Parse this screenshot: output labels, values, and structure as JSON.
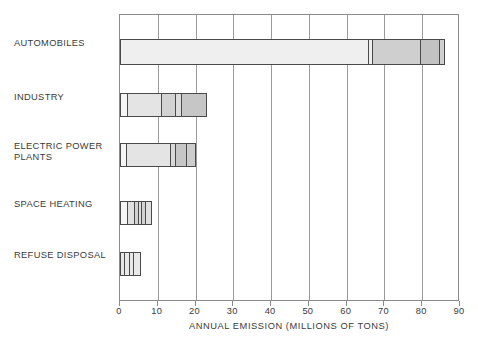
{
  "chart_data": {
    "type": "bar",
    "orientation": "horizontal",
    "title": "",
    "xlabel": "ANNUAL EMISSION (MILLIONS OF TONS)",
    "ylabel": "",
    "xlim": [
      0,
      90
    ],
    "xticks": [
      0,
      10,
      20,
      30,
      40,
      50,
      60,
      70,
      80,
      90
    ],
    "xtick_labels": [
      "0",
      "10",
      "20",
      "30",
      "40",
      "50",
      "60",
      "70",
      "80",
      "90"
    ],
    "grid": "vertical",
    "legend": "none",
    "categories": [
      "AUTOMOBILES",
      "INDUSTRY",
      "ELECTRIC POWER\nPLANTS",
      "SPACE HEATING",
      "REFUSE DISPOSAL"
    ],
    "totals": [
      86,
      23,
      20,
      8.5,
      5.5
    ],
    "stacked_segments": [
      {
        "category": "AUTOMOBILES",
        "total": 86,
        "segments": [
          {
            "start": 0,
            "end": 66,
            "value": 66,
            "fill": "#efefef"
          },
          {
            "start": 66,
            "end": 67,
            "value": 1,
            "fill": "#efefef"
          },
          {
            "start": 67,
            "end": 80,
            "value": 13,
            "fill": "#cfcfcf"
          },
          {
            "start": 80,
            "end": 85,
            "value": 5,
            "fill": "#c2c2c2"
          },
          {
            "start": 85,
            "end": 86,
            "value": 1,
            "fill": "#cfcfcf"
          }
        ]
      },
      {
        "category": "INDUSTRY",
        "total": 23,
        "segments": [
          {
            "start": 0,
            "end": 2,
            "value": 2,
            "fill": "#f5f5f5"
          },
          {
            "start": 2,
            "end": 11,
            "value": 9,
            "fill": "#e4e4e4"
          },
          {
            "start": 11,
            "end": 15,
            "value": 4,
            "fill": "#d2d2d2"
          },
          {
            "start": 15,
            "end": 16.5,
            "value": 1.5,
            "fill": "#dcdcdc"
          },
          {
            "start": 16.5,
            "end": 23,
            "value": 6.5,
            "fill": "#c6c6c6"
          }
        ]
      },
      {
        "category": "ELECTRIC POWER PLANTS",
        "total": 20,
        "segments": [
          {
            "start": 0,
            "end": 1.5,
            "value": 1.5,
            "fill": "#f5f5f5"
          },
          {
            "start": 1.5,
            "end": 13.5,
            "value": 12,
            "fill": "#e4e4e4"
          },
          {
            "start": 13.5,
            "end": 15,
            "value": 1.5,
            "fill": "#d8d8d8"
          },
          {
            "start": 15,
            "end": 18,
            "value": 3,
            "fill": "#c6c6c6"
          },
          {
            "start": 18,
            "end": 20,
            "value": 2,
            "fill": "#cccccc"
          }
        ]
      },
      {
        "category": "SPACE HEATING",
        "total": 8.5,
        "segments": [
          {
            "start": 0,
            "end": 2,
            "value": 2,
            "fill": "#f5f5f5"
          },
          {
            "start": 2,
            "end": 4,
            "value": 2,
            "fill": "#e0e0e0"
          },
          {
            "start": 4,
            "end": 5,
            "value": 1,
            "fill": "#d2d2d2"
          },
          {
            "start": 5,
            "end": 6,
            "value": 1,
            "fill": "#dcdcdc"
          },
          {
            "start": 6,
            "end": 7,
            "value": 1,
            "fill": "#d2d2d2"
          },
          {
            "start": 7,
            "end": 8.5,
            "value": 1.5,
            "fill": "#e0e0e0"
          }
        ]
      },
      {
        "category": "REFUSE DISPOSAL",
        "total": 5.5,
        "segments": [
          {
            "start": 0,
            "end": 1.3,
            "value": 1.3,
            "fill": "#e8e8e8"
          },
          {
            "start": 1.3,
            "end": 2.6,
            "value": 1.3,
            "fill": "#e8e8e8"
          },
          {
            "start": 2.6,
            "end": 3.9,
            "value": 1.3,
            "fill": "#e8e8e8"
          },
          {
            "start": 3.9,
            "end": 5.5,
            "value": 1.6,
            "fill": "#e8e8e8"
          }
        ]
      }
    ]
  },
  "axis": {
    "title": "ANNUAL EMISSION (MILLIONS OF TONS)",
    "ticks": [
      "0",
      "10",
      "20",
      "30",
      "40",
      "50",
      "60",
      "70",
      "80",
      "90"
    ]
  },
  "categories": {
    "automobiles": "AUTOMOBILES",
    "industry": "INDUSTRY",
    "electric_power_plants": "ELECTRIC POWER\nPLANTS",
    "space_heating": "SPACE HEATING",
    "refuse_disposal": "REFUSE DISPOSAL"
  },
  "colors": {
    "frame": "#8a8a8a",
    "gridline": "#9a9a9a",
    "bar_outline": "#4a4a4a",
    "text": "#3a3a3a",
    "background": "#ffffff"
  }
}
